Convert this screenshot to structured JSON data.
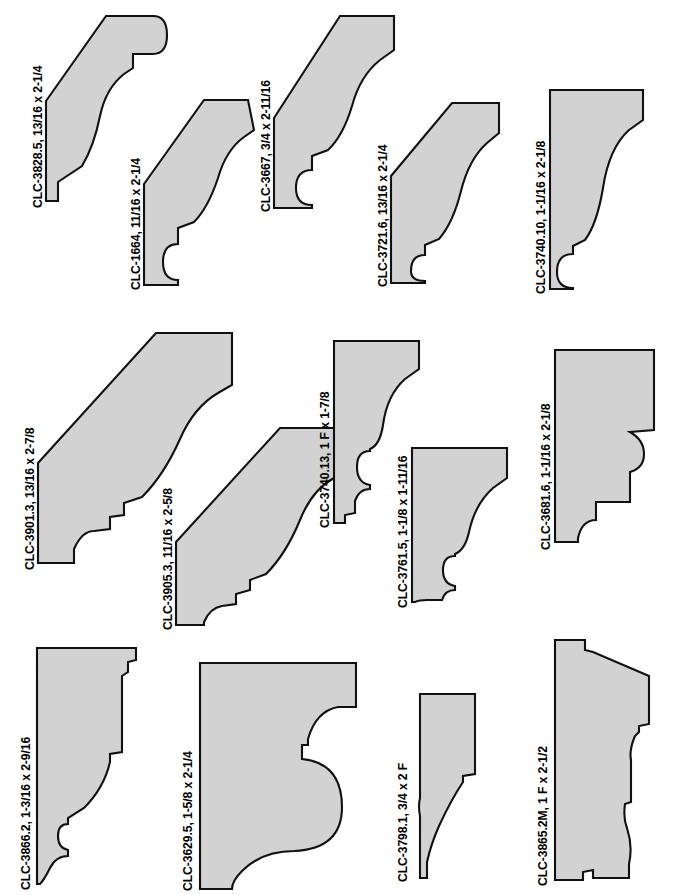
{
  "document": {
    "kind": "molding-profile-catalog-sheet",
    "background_color": "#ffffff",
    "profile_fill_color": "#d2d2d2",
    "profile_stroke_color": "#111111",
    "page_width": 680,
    "page_height": 895
  },
  "profiles": [
    {
      "id": "CLC-3828.5",
      "label": "CLC-3828.5,  13/16 x 2-1/4",
      "code": "CLC-3828.5",
      "dimensions": "13/16 x 2-1/4",
      "row": 1,
      "column": 1
    },
    {
      "id": "CLC-1664",
      "label": "CLC-1664,  11/16 x 2-1/4",
      "code": "CLC-1664",
      "dimensions": "11/16 x 2-1/4",
      "row": 1,
      "column": 2
    },
    {
      "id": "CLC-3667",
      "label": "CLC-3667,  3/4 x 2-11/16",
      "code": "CLC-3667",
      "dimensions": "3/4 x 2-11/16",
      "row": 1,
      "column": 3
    },
    {
      "id": "CLC-3721.6",
      "label": "CLC-3721.6,  13/16 x 2-1/4",
      "code": "CLC-3721.6",
      "dimensions": "13/16 x 2-1/4",
      "row": 1,
      "column": 4
    },
    {
      "id": "CLC-3740.10",
      "label": "CLC-3740.10,  1-1/16 x 2-1/8",
      "code": "CLC-3740.10",
      "dimensions": "1-1/16 x 2-1/8",
      "row": 1,
      "column": 5
    },
    {
      "id": "CLC-3901.3",
      "label": "CLC-3901.3,  13/16 x 2-7/8",
      "code": "CLC-3901.3",
      "dimensions": "13/16 x 2-7/8",
      "row": 2,
      "column": 1
    },
    {
      "id": "CLC-3905.3",
      "label": "CLC-3905.3,  11/16 x 2-5/8",
      "code": "CLC-3905.3",
      "dimensions": "11/16 x 2-5/8",
      "row": 2,
      "column": 2
    },
    {
      "id": "CLC-3740.13",
      "label": "CLC-3740.13,  1 F x 1-7/8",
      "code": "CLC-3740.13",
      "dimensions": "1 F x 1-7/8",
      "row": 2,
      "column": 3
    },
    {
      "id": "CLC-3761.5",
      "label": "CLC-3761.5,  1-1/8 x 1-11/16",
      "code": "CLC-3761.5",
      "dimensions": "1-1/8 x 1-11/16",
      "row": 2,
      "column": 4
    },
    {
      "id": "CLC-3681.6",
      "label": "CLC-3681.6,  1-1/16 x 2-1/8",
      "code": "CLC-3681.6",
      "dimensions": "1-1/16 x 2-1/8",
      "row": 2,
      "column": 5
    },
    {
      "id": "CLC-3866.2",
      "label": "CLC-3866.2,  1-3/16 x 2-9/16",
      "code": "CLC-3866.2",
      "dimensions": "1-3/16 x 2-9/16",
      "row": 3,
      "column": 1
    },
    {
      "id": "CLC-3629.5",
      "label": "CLC-3629.5,  1-5/8 x 2-1/4",
      "code": "CLC-3629.5",
      "dimensions": "1-5/8 x 2-1/4",
      "row": 3,
      "column": 2
    },
    {
      "id": "CLC-3798.1",
      "label": "CLC-3798.1,  3/4 x 2 F",
      "code": "CLC-3798.1",
      "dimensions": "3/4 x 2 F",
      "row": 3,
      "column": 3
    },
    {
      "id": "CLC-3865.2M",
      "label": "CLC-3865.2M,  1 F x 2-1/2",
      "code": "CLC-3865.2M",
      "dimensions": "1 F x 2-1/2",
      "row": 3,
      "column": 4
    }
  ]
}
